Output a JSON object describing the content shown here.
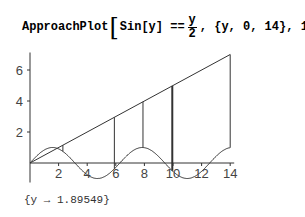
{
  "input": {
    "func": "ApproachPlot",
    "lhs": "Sin[y] ==",
    "frac_num": "y",
    "frac_den": "2",
    "rest": ", {y, 0, 14}, 10"
  },
  "output": "{y → 1.89549}",
  "chart_data": {
    "type": "line",
    "xlabel": "",
    "ylabel": "",
    "xlim": [
      0,
      14
    ],
    "ylim": [
      -1,
      7
    ],
    "x_ticks": [
      2,
      4,
      6,
      8,
      10,
      12,
      14
    ],
    "y_ticks": [
      2,
      4,
      6
    ],
    "grid": false,
    "series": [
      {
        "name": "Sin[y]",
        "function": "sin(y)",
        "x_range": [
          0,
          14
        ]
      },
      {
        "name": "y/2",
        "function": "y/2",
        "x_range": [
          0,
          14
        ]
      }
    ],
    "approach_segments_x": [
      2.3,
      5.9,
      7.9,
      9.95,
      14
    ],
    "result": {
      "y": 1.89549
    }
  }
}
